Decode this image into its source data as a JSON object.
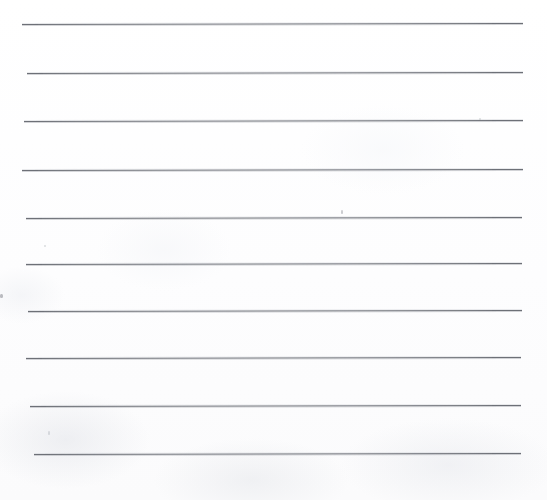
{
  "document": {
    "kind": "scanned-lined-paper",
    "title": "Lined Paper Scan",
    "description": "Blank sheet of ruled writing paper, scanned",
    "width": 547,
    "height": 500,
    "background_color": "#fefefe",
    "paper_tone": "#fdfdfe",
    "rule_color": "#6d7077",
    "rule_halo_color": "#9699a0",
    "rule_count": 10,
    "written_text": "",
    "visible_labels": []
  },
  "rules": [
    {
      "id": "rule-1",
      "label": "ruled line 1",
      "x": 22,
      "y": 24,
      "length": 501,
      "angle_deg": -0.12,
      "thickness": 1
    },
    {
      "id": "rule-2",
      "label": "ruled line 2",
      "x": 27,
      "y": 73,
      "length": 496,
      "angle_deg": -0.12,
      "thickness": 1
    },
    {
      "id": "rule-3",
      "label": "ruled line 3",
      "x": 24,
      "y": 121,
      "length": 499,
      "angle_deg": -0.12,
      "thickness": 1
    },
    {
      "id": "rule-4",
      "label": "ruled line 4",
      "x": 22,
      "y": 170,
      "length": 501,
      "angle_deg": -0.12,
      "thickness": 1
    },
    {
      "id": "rule-5",
      "label": "ruled line 5",
      "x": 26,
      "y": 218,
      "length": 496,
      "angle_deg": -0.12,
      "thickness": 1
    },
    {
      "id": "rule-6",
      "label": "ruled line 6",
      "x": 26,
      "y": 264,
      "length": 496,
      "angle_deg": -0.12,
      "thickness": 1
    },
    {
      "id": "rule-7",
      "label": "ruled line 7",
      "x": 28,
      "y": 311,
      "length": 494,
      "angle_deg": -0.12,
      "thickness": 1
    },
    {
      "id": "rule-8",
      "label": "ruled line 8",
      "x": 26,
      "y": 358,
      "length": 495,
      "angle_deg": -0.12,
      "thickness": 1
    },
    {
      "id": "rule-9",
      "label": "ruled line 9",
      "x": 30,
      "y": 406,
      "length": 491,
      "angle_deg": -0.12,
      "thickness": 1
    },
    {
      "id": "rule-10",
      "label": "ruled line 10",
      "x": 34,
      "y": 454,
      "length": 487,
      "angle_deg": -0.12,
      "thickness": 1
    }
  ],
  "specks": [
    {
      "id": "speck-1",
      "label": "scan speck near center",
      "x": 341,
      "y": 210,
      "w": 2,
      "h": 4,
      "variant": "normal"
    },
    {
      "id": "speck-2",
      "label": "scan speck lower left",
      "x": 48,
      "y": 431,
      "w": 2,
      "h": 4,
      "variant": "faint"
    },
    {
      "id": "speck-3",
      "label": "scan artifact at left edge",
      "x": 0,
      "y": 294,
      "w": 3,
      "h": 4,
      "variant": "edge"
    },
    {
      "id": "speck-4",
      "label": "scan speck upper left",
      "x": 44,
      "y": 245,
      "w": 2,
      "h": 2,
      "variant": "faint"
    },
    {
      "id": "speck-5",
      "label": "scan speck upper right",
      "x": 479,
      "y": 118,
      "w": 2,
      "h": 2,
      "variant": "faint"
    }
  ]
}
